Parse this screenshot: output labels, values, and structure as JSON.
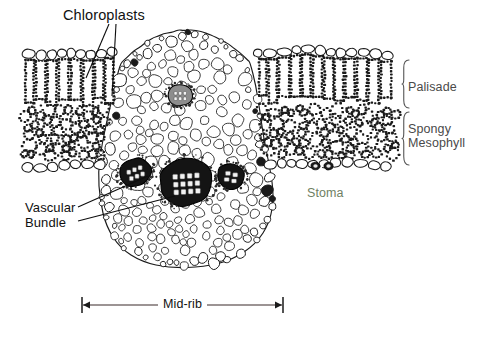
{
  "figure": {
    "background": "#ffffff",
    "ink": "#1a1a1a",
    "width": 491,
    "height": 337
  },
  "labels": {
    "chloroplasts": "Chloroplasts",
    "palisade": "Palisade",
    "spongy": "Spongy\nMesophyll",
    "stoma": "Stoma",
    "vascular_bundle": "Vascular\nBundle",
    "midrib": "Mid-rib"
  },
  "label_colors": {
    "chloroplasts": "#111111",
    "palisade": "#4a4a4a",
    "spongy": "#4a4a4a",
    "stoma": "#6f7f63",
    "vascular_bundle": "#111111",
    "midrib": "#1a1a1a"
  },
  "leaders": {
    "chloroplasts": [
      {
        "x1": 109,
        "y1": 24,
        "x2": 86,
        "y2": 78
      },
      {
        "x1": 116,
        "y1": 24,
        "x2": 112,
        "y2": 96
      }
    ],
    "vascular_bundle": [
      {
        "x1": 78,
        "y1": 207,
        "x2": 148,
        "y2": 176
      },
      {
        "x1": 78,
        "y1": 221,
        "x2": 175,
        "y2": 196
      }
    ]
  },
  "braces": {
    "palisade": {
      "x": 402,
      "y_top": 60,
      "y_bottom": 108
    },
    "spongy": {
      "x": 402,
      "y_top": 112,
      "y_bottom": 165
    }
  },
  "scale_bar": {
    "label": "Mid-rib",
    "x_left": 82,
    "x_right": 283,
    "y": 305,
    "tick_height": 16
  },
  "structures": {
    "upper_epidermis": {
      "name": "Upper epidermis",
      "cell_fill": "#ffffff"
    },
    "lower_epidermis": {
      "name": "Lower epidermis",
      "cell_fill": "#ffffff"
    },
    "palisade_layer": {
      "name": "Palisade mesophyll",
      "chloroplast_color": "#111111"
    },
    "spongy_layer": {
      "name": "Spongy mesophyll",
      "chloroplast_color": "#1c1c1c"
    },
    "midrib_parenchyma": {
      "name": "Midrib parenchyma",
      "cell_fill": "#ffffff"
    },
    "stoma": {
      "name": "Stoma with guard cells",
      "guard_cell_color": "#1a1a1a"
    }
  },
  "vascular_bundles": [
    {
      "name": "central-bundle",
      "cx": 186,
      "cy": 182,
      "rx": 27,
      "ry": 24,
      "rotation": -4,
      "xylem_rows": 3,
      "xylem_cols": 4
    },
    {
      "name": "left-bundle",
      "cx": 135,
      "cy": 172,
      "rx": 17,
      "ry": 14,
      "rotation": -22,
      "xylem_rows": 2,
      "xylem_cols": 3
    },
    {
      "name": "right-bundle",
      "cx": 231,
      "cy": 176,
      "rx": 14,
      "ry": 13,
      "rotation": 12,
      "xylem_rows": 2,
      "xylem_cols": 2
    },
    {
      "name": "dome-bundle",
      "cx": 180,
      "cy": 95,
      "rx": 13,
      "ry": 11,
      "rotation": 0,
      "xylem_rows": 2,
      "xylem_cols": 3
    }
  ],
  "geometry": {
    "lamina_left": {
      "x_start": 22,
      "x_end": 120,
      "surface_y": 57,
      "bottom_y": 160
    },
    "lamina_right": {
      "x_start": 246,
      "x_end": 398,
      "surface_y": 58,
      "bottom_y": 163
    },
    "midrib_dome": {
      "cx": 186,
      "top_y": 28,
      "half_width": 70
    },
    "midrib_bottom": {
      "cx": 186,
      "bottom_y": 268,
      "half_width": 88
    }
  }
}
